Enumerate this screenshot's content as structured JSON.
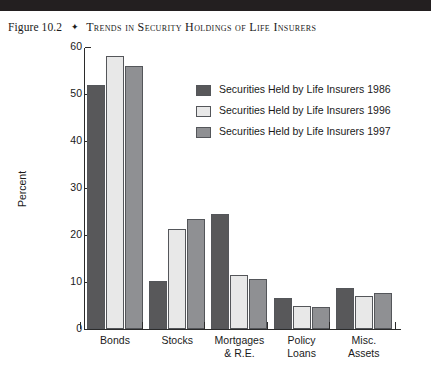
{
  "header": {
    "figure_number": "Figure 10.2",
    "diamond": "✦",
    "title": "Trends in Security Holdings of Life Insurers"
  },
  "chart_data": {
    "type": "bar",
    "title": "Trends in Security Holdings of Life Insurers",
    "xlabel": "",
    "ylabel": "Percent",
    "ylim": [
      0,
      60
    ],
    "yticks": [
      0,
      10,
      20,
      30,
      40,
      50,
      60
    ],
    "grid": false,
    "legend_position": "upper-right-inside",
    "categories": [
      "Bonds",
      "Stocks",
      "Mortgages & R.E.",
      "Policy Loans",
      "Misc. Assets"
    ],
    "category_lines": [
      [
        "Bonds"
      ],
      [
        "Stocks"
      ],
      [
        "Mortgages",
        "& R.E."
      ],
      [
        "Policy",
        "Loans"
      ],
      [
        "Misc.",
        "Assets"
      ]
    ],
    "series": [
      {
        "name": "Securities Held by Life Insurers 1986",
        "color": "#58585a",
        "values": [
          52.0,
          10.2,
          24.5,
          6.5,
          8.7
        ]
      },
      {
        "name": "Securities Held by Life Insurers 1996",
        "color": "#e8e8e8",
        "values": [
          58.0,
          21.2,
          11.5,
          4.8,
          7.0
        ]
      },
      {
        "name": "Securities Held by Life Insurers 1997",
        "color": "#8f9093",
        "values": [
          56.0,
          23.4,
          10.6,
          4.7,
          7.7
        ]
      }
    ]
  },
  "colors": {
    "series_1986": "#58585a",
    "series_1996": "#e8e8e8",
    "series_1997": "#8f9093",
    "axis": "#2b2b2b",
    "header_rule": "#231f20",
    "text": "#1a1a1a"
  }
}
